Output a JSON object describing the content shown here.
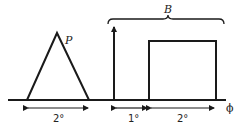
{
  "diagram": {
    "labels": {
      "triangle": "P",
      "brace": "B",
      "axis": "ϕ",
      "dim_triangle": "2°",
      "dim_gap": "1°",
      "dim_rect": "2°"
    },
    "colors": {
      "stroke": "#1a1a1a",
      "background": "#ffffff"
    }
  }
}
